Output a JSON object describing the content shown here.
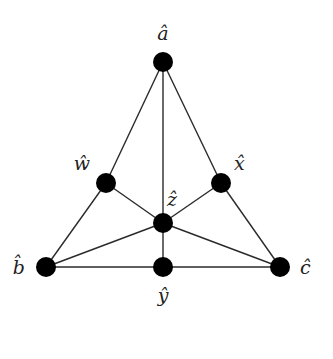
{
  "diagram": {
    "type": "Fano-plane-like triangle graph",
    "node_color": "#000000",
    "edge_color": "#2a2a2a",
    "nodes": [
      {
        "id": "a",
        "label": "â"
      },
      {
        "id": "w",
        "label": "ŵ"
      },
      {
        "id": "x",
        "label": "x̂"
      },
      {
        "id": "z",
        "label": "ẑ"
      },
      {
        "id": "b",
        "label": "b̂"
      },
      {
        "id": "y",
        "label": "ŷ"
      },
      {
        "id": "c",
        "label": "ĉ"
      }
    ],
    "edges": [
      [
        "a",
        "w"
      ],
      [
        "w",
        "b"
      ],
      [
        "a",
        "x"
      ],
      [
        "x",
        "c"
      ],
      [
        "b",
        "y"
      ],
      [
        "y",
        "c"
      ],
      [
        "a",
        "z"
      ],
      [
        "z",
        "y"
      ],
      [
        "w",
        "z"
      ],
      [
        "z",
        "c"
      ],
      [
        "x",
        "z"
      ],
      [
        "z",
        "b"
      ]
    ]
  }
}
